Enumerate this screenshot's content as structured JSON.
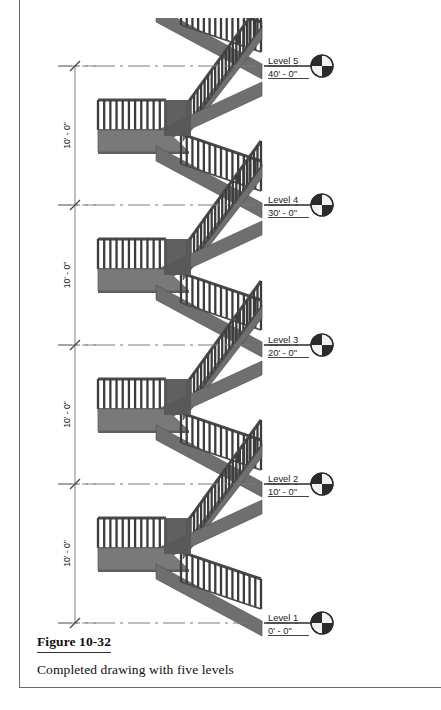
{
  "figure": {
    "label": "Figure 10-32",
    "description": "Completed drawing with five levels"
  },
  "drawing": {
    "type": "stair-elevation",
    "title_visible": false,
    "levels": [
      {
        "name": "Level 5",
        "elevation": "40' - 0\"",
        "y": 66
      },
      {
        "name": "Level 4",
        "elevation": "30' - 0\"",
        "y": 205
      },
      {
        "name": "Level 3",
        "elevation": "20' - 0\"",
        "y": 345
      },
      {
        "name": "Level 2",
        "elevation": "10' - 0\"",
        "y": 484
      },
      {
        "name": "Level 1",
        "elevation": "0' - 0\"",
        "y": 623
      }
    ],
    "dimensions": [
      {
        "text": "10' - 0\"",
        "from": "Level 5",
        "to": "Level 4"
      },
      {
        "text": "10' - 0\"",
        "from": "Level 4",
        "to": "Level 3"
      },
      {
        "text": "10' - 0\"",
        "from": "Level 3",
        "to": "Level 2"
      },
      {
        "text": "10' - 0\"",
        "from": "Level 2",
        "to": "Level 1"
      }
    ],
    "level_marker_icon": "level-head-circle-icon",
    "colors": {
      "baluster": "#3c3c3c",
      "rail": "#4a4a4a",
      "stringer": "#6f6f6f",
      "stringer_dark": "#575757",
      "slab": "#797979",
      "slab_edge": "#5e5e5e",
      "datum_line": "#7a7a7a",
      "dim_line": "#8a8a8a",
      "marker_dark": "#2b2b2b",
      "marker_light": "#f2f2f2",
      "frame": "#6a6a6a"
    }
  }
}
